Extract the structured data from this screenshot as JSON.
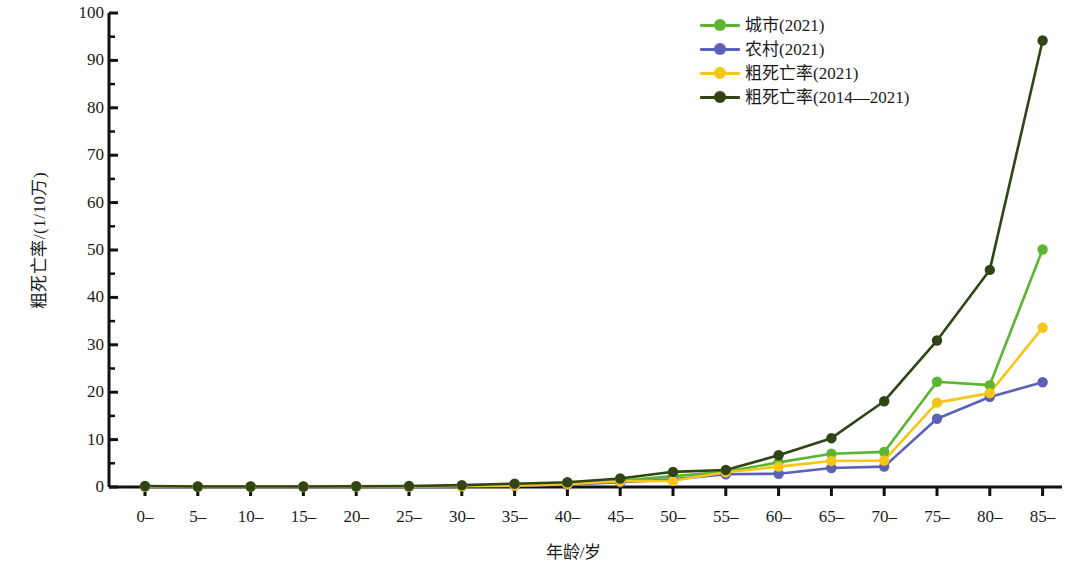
{
  "chart_data": {
    "type": "line",
    "title": "",
    "xlabel": "年龄/岁",
    "ylabel": "粗死亡率/(1/10万)",
    "categories": [
      "0–",
      "5–",
      "10–",
      "15–",
      "20–",
      "25–",
      "30–",
      "35–",
      "40–",
      "45–",
      "50–",
      "55–",
      "60–",
      "65–",
      "70–",
      "75–",
      "80–",
      "85–"
    ],
    "ylim": [
      0,
      100
    ],
    "yticks": [
      0,
      10,
      20,
      30,
      40,
      50,
      60,
      70,
      80,
      90,
      100
    ],
    "ytick_minor_step": 5,
    "grid": false,
    "legend_position": "top-right",
    "series": [
      {
        "name": "城市(2021)",
        "color": "#5cb531",
        "values": [
          0.1,
          0.05,
          0.05,
          0.05,
          0.1,
          0.1,
          0.2,
          0.3,
          0.6,
          1.3,
          2.3,
          3.2,
          5.2,
          7.0,
          7.4,
          22.2,
          21.5,
          50.1
        ]
      },
      {
        "name": "农村(2021)",
        "color": "#5b62b5",
        "values": [
          0.1,
          0.05,
          0.05,
          0.05,
          0.1,
          0.1,
          0.15,
          0.25,
          0.5,
          1.0,
          1.6,
          2.7,
          2.8,
          4.0,
          4.3,
          14.4,
          19.0,
          22.1
        ]
      },
      {
        "name": "粗死亡率(2021)",
        "color": "#f5c518",
        "values": [
          0.1,
          0.05,
          0.05,
          0.05,
          0.1,
          0.1,
          0.2,
          0.3,
          0.6,
          1.2,
          1.3,
          3.1,
          4.3,
          5.5,
          5.6,
          17.8,
          19.8,
          33.6
        ]
      },
      {
        "name": "粗死亡率(2014—2021)",
        "color": "#2f4515",
        "values": [
          0.2,
          0.1,
          0.1,
          0.1,
          0.15,
          0.2,
          0.4,
          0.7,
          1.0,
          1.8,
          3.2,
          3.6,
          6.7,
          10.3,
          18.1,
          30.9,
          45.8,
          94.2
        ]
      }
    ]
  },
  "axes": {
    "y_tick_labels": [
      "100",
      "90",
      "80",
      "70",
      "60",
      "50",
      "40",
      "30",
      "20",
      "10",
      "0"
    ],
    "x_tick_labels": [
      "0–",
      "5–",
      "10–",
      "15–",
      "20–",
      "25–",
      "30–",
      "35–",
      "40–",
      "45–",
      "50–",
      "55–",
      "60–",
      "65–",
      "70–",
      "75–",
      "80–",
      "85–"
    ]
  },
  "legend": {
    "items": [
      {
        "label": "城市(2021)",
        "color": "#5cb531"
      },
      {
        "label": "农村(2021)",
        "color": "#5b62b5"
      },
      {
        "label": "粗死亡率(2021)",
        "color": "#f5c518"
      },
      {
        "label": "粗死亡率(2014—2021)",
        "color": "#2f4515"
      }
    ]
  }
}
